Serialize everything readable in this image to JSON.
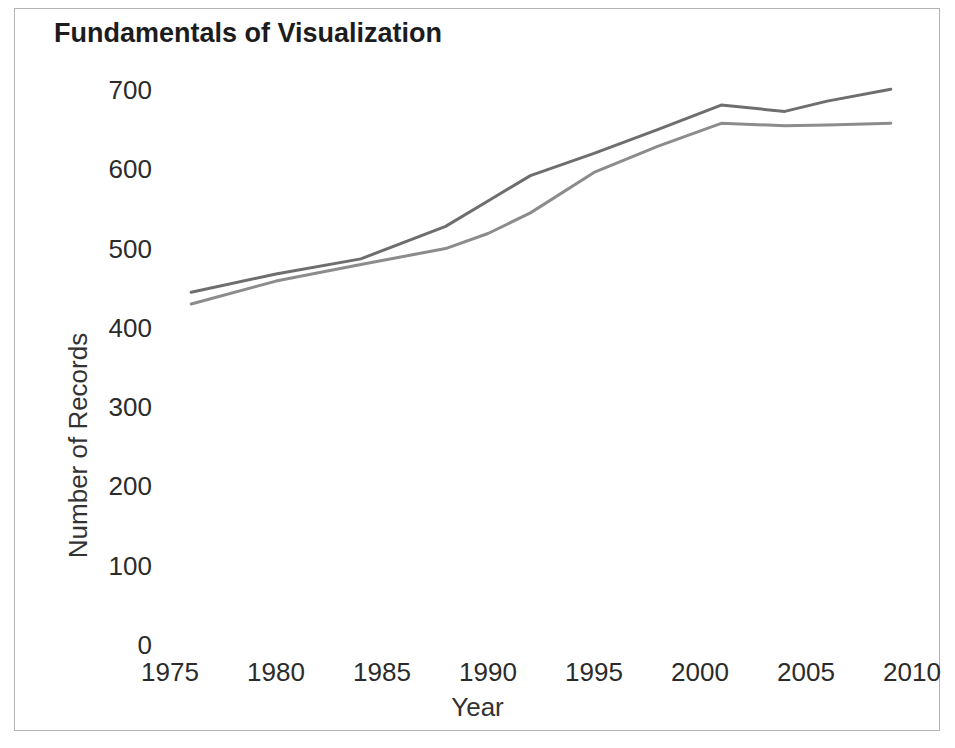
{
  "chart_data": {
    "type": "line",
    "title": "Fundamentals of Visualization",
    "xlabel": "Year",
    "ylabel": "Number of Records",
    "xlim": [
      1975,
      2010
    ],
    "ylim": [
      0,
      740
    ],
    "grid": false,
    "legend": "none",
    "xticks": [
      "1975",
      "1980",
      "1985",
      "1990",
      "1995",
      "2000",
      "2005",
      "2010"
    ],
    "xtick_values": [
      1975,
      1980,
      1985,
      1990,
      1995,
      2000,
      2005,
      2010
    ],
    "yticks": [
      "0",
      "100",
      "200",
      "300",
      "400",
      "500",
      "600",
      "700"
    ],
    "ytick_values": [
      0,
      100,
      200,
      300,
      400,
      500,
      600,
      700
    ],
    "series": [
      {
        "name": "series-upper",
        "color": "#6e6e6e",
        "x": [
          1976,
          1980,
          1984,
          1988,
          1990,
          1992,
          1995,
          1998,
          2001,
          2004,
          2006,
          2009
        ],
        "values": [
          445,
          468,
          487,
          528,
          560,
          592,
          620,
          650,
          681,
          673,
          686,
          701
        ]
      },
      {
        "name": "series-lower",
        "color": "#8c8c8c",
        "x": [
          1976,
          1980,
          1984,
          1988,
          1990,
          1992,
          1995,
          1998,
          2001,
          2004,
          2006,
          2009
        ],
        "values": [
          430,
          459,
          480,
          500,
          519,
          545,
          596,
          629,
          658,
          655,
          656,
          658
        ]
      }
    ]
  }
}
